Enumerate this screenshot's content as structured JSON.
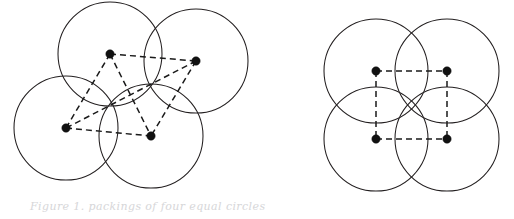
{
  "figure": {
    "background_color": "#ffffff",
    "stroke_color": "#231f20",
    "dot_color": "#111111",
    "dash_color": "#1a1a1a",
    "width": 514,
    "height": 219,
    "caption": "Figure 1. packings of four equal circles",
    "panels": [
      {
        "name": "left-panel",
        "label": "irregular four-circle arrangement",
        "circles": [
          {
            "name": "circle-top-left",
            "cx": 110,
            "cy": 54,
            "r": 52
          },
          {
            "name": "circle-top-right",
            "cx": 196,
            "cy": 61,
            "r": 52
          },
          {
            "name": "circle-bottom-left",
            "cx": 66,
            "cy": 128,
            "r": 52
          },
          {
            "name": "circle-bottom-right",
            "cx": 151,
            "cy": 136,
            "r": 52
          }
        ],
        "centers": [
          {
            "name": "center-dot-top-left",
            "cx": 110,
            "cy": 54,
            "r": 4.2
          },
          {
            "name": "center-dot-top-right",
            "cx": 196,
            "cy": 61,
            "r": 4.2
          },
          {
            "name": "center-dot-bottom-left",
            "cx": 66,
            "cy": 128,
            "r": 4.2
          },
          {
            "name": "center-dot-bottom-right",
            "cx": 151,
            "cy": 136,
            "r": 4.2
          }
        ],
        "links": [
          {
            "name": "link-top-edge",
            "x1": 110,
            "y1": 54,
            "x2": 196,
            "y2": 61
          },
          {
            "name": "link-bottom-edge",
            "x1": 66,
            "y1": 128,
            "x2": 151,
            "y2": 136
          },
          {
            "name": "link-left-edge",
            "x1": 110,
            "y1": 54,
            "x2": 66,
            "y2": 128
          },
          {
            "name": "link-right-edge",
            "x1": 196,
            "y1": 61,
            "x2": 151,
            "y2": 136
          },
          {
            "name": "link-diagonal-a",
            "x1": 110,
            "y1": 54,
            "x2": 151,
            "y2": 136
          },
          {
            "name": "link-diagonal-b",
            "x1": 196,
            "y1": 61,
            "x2": 66,
            "y2": 128
          }
        ]
      },
      {
        "name": "right-panel",
        "label": "square four-circle arrangement",
        "circles": [
          {
            "name": "circle-top-left",
            "cx": 376,
            "cy": 71,
            "r": 52
          },
          {
            "name": "circle-top-right",
            "cx": 447,
            "cy": 71,
            "r": 52
          },
          {
            "name": "circle-bottom-left",
            "cx": 376,
            "cy": 139,
            "r": 52
          },
          {
            "name": "circle-bottom-right",
            "cx": 447,
            "cy": 139,
            "r": 52
          }
        ],
        "centers": [
          {
            "name": "center-dot-top-left",
            "cx": 376,
            "cy": 71,
            "r": 4.2
          },
          {
            "name": "center-dot-top-right",
            "cx": 447,
            "cy": 71,
            "r": 4.2
          },
          {
            "name": "center-dot-bottom-left",
            "cx": 376,
            "cy": 139,
            "r": 4.2
          },
          {
            "name": "center-dot-bottom-right",
            "cx": 447,
            "cy": 139,
            "r": 4.2
          }
        ],
        "links": [
          {
            "name": "link-top-edge",
            "x1": 376,
            "y1": 71,
            "x2": 447,
            "y2": 71
          },
          {
            "name": "link-bottom-edge",
            "x1": 376,
            "y1": 139,
            "x2": 447,
            "y2": 139
          },
          {
            "name": "link-left-edge",
            "x1": 376,
            "y1": 71,
            "x2": 376,
            "y2": 139
          },
          {
            "name": "link-right-edge",
            "x1": 447,
            "y1": 71,
            "x2": 447,
            "y2": 139
          }
        ]
      }
    ]
  }
}
